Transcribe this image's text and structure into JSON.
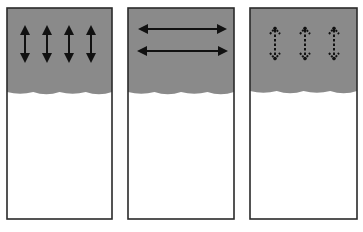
{
  "figure": {
    "colors": {
      "background": "#ffffff",
      "fill": "#8a8a8a",
      "border": "#2a2a2a",
      "arrow": "#111111"
    },
    "panels": [
      {
        "id": "panel-1",
        "x": 7,
        "y": 8,
        "width": 105,
        "height": 211,
        "fill_bottom": 93,
        "arrow_style": "solid",
        "arrow_orientation": "vertical",
        "arrows": [
          {
            "x1": 25,
            "y1": 27,
            "x2": 25,
            "y2": 61
          },
          {
            "x1": 47,
            "y1": 27,
            "x2": 47,
            "y2": 61
          },
          {
            "x1": 69,
            "y1": 27,
            "x2": 69,
            "y2": 61
          },
          {
            "x1": 91,
            "y1": 27,
            "x2": 91,
            "y2": 61
          }
        ]
      },
      {
        "id": "panel-2",
        "x": 128,
        "y": 8,
        "width": 106,
        "height": 211,
        "fill_bottom": 93,
        "arrow_style": "solid",
        "arrow_orientation": "horizontal",
        "arrows": [
          {
            "x1": 140,
            "y1": 29,
            "x2": 225,
            "y2": 29
          },
          {
            "x1": 139,
            "y1": 51,
            "x2": 226,
            "y2": 51
          }
        ]
      },
      {
        "id": "panel-3",
        "x": 250,
        "y": 8,
        "width": 107,
        "height": 211,
        "fill_bottom": 92,
        "arrow_style": "dotted",
        "arrow_orientation": "vertical",
        "arrows": [
          {
            "x1": 275,
            "y1": 28,
            "x2": 275,
            "y2": 59
          },
          {
            "x1": 305,
            "y1": 28,
            "x2": 305,
            "y2": 59
          },
          {
            "x1": 334,
            "y1": 28,
            "x2": 334,
            "y2": 59
          }
        ]
      }
    ]
  }
}
